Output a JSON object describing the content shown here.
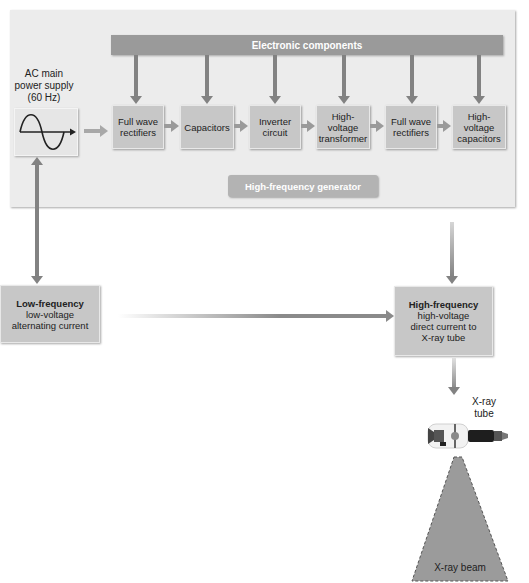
{
  "diagram": {
    "generator_panel": {
      "top_bar_label": "Electronic components",
      "bottom_label": "High-frequency generator"
    },
    "power_supply": {
      "label_lines": [
        "AC main",
        "power supply",
        "(60 Hz)"
      ],
      "icon": "sine-wave-icon"
    },
    "components": [
      {
        "lines": [
          "Full wave",
          "rectifiers"
        ]
      },
      {
        "lines": [
          "Capacitors"
        ]
      },
      {
        "lines": [
          "Inverter",
          "circuit"
        ]
      },
      {
        "lines": [
          "High-",
          "voltage",
          "transformer"
        ]
      },
      {
        "lines": [
          "Full wave",
          "rectifiers"
        ]
      },
      {
        "lines": [
          "High-",
          "voltage",
          "capacitors"
        ]
      }
    ],
    "low_frequency_box": {
      "title": "Low-frequency",
      "lines": [
        "low-voltage",
        "alternating current"
      ]
    },
    "high_frequency_box": {
      "title": "High-frequency",
      "lines": [
        "high-voltage",
        "direct current to",
        "X-ray tube"
      ]
    },
    "xray_tube": {
      "label_lines": [
        "X-ray",
        "tube"
      ]
    },
    "xray_beam": {
      "label": "X-ray beam"
    },
    "colors": {
      "panel_bg": "#ececec",
      "component_box": "#c7c7c7",
      "bar": "#9a9a9a",
      "arrow": "#828282"
    }
  }
}
